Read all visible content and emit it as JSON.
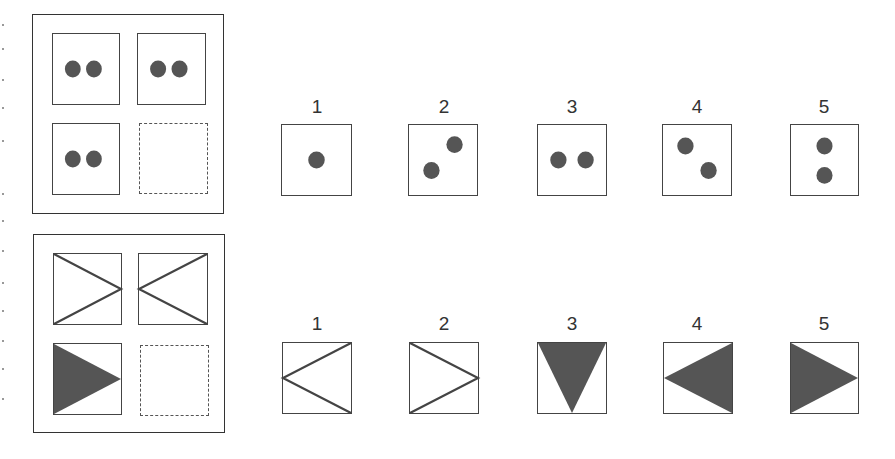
{
  "colors": {
    "fill": "#555555",
    "line": "#444444"
  },
  "puzzle1": {
    "name": "dots-matrix",
    "matrix": [
      {
        "pos": "top-left",
        "dots": [
          [
            0.3,
            0.5
          ],
          [
            0.62,
            0.5
          ]
        ]
      },
      {
        "pos": "top-right",
        "dots": [
          [
            0.3,
            0.5
          ],
          [
            0.62,
            0.5
          ]
        ]
      },
      {
        "pos": "bottom-left",
        "dots": [
          [
            0.3,
            0.5
          ],
          [
            0.62,
            0.5
          ]
        ]
      },
      {
        "pos": "bottom-right",
        "missing": true
      }
    ],
    "options": [
      {
        "label": "1",
        "dots": [
          [
            0.5,
            0.5
          ]
        ]
      },
      {
        "label": "2",
        "dots": [
          [
            0.33,
            0.65
          ],
          [
            0.67,
            0.28
          ]
        ]
      },
      {
        "label": "3",
        "dots": [
          [
            0.3,
            0.5
          ],
          [
            0.7,
            0.5
          ]
        ]
      },
      {
        "label": "4",
        "dots": [
          [
            0.33,
            0.3
          ],
          [
            0.67,
            0.65
          ]
        ]
      },
      {
        "label": "5",
        "dots": [
          [
            0.5,
            0.3
          ],
          [
            0.5,
            0.72
          ]
        ]
      }
    ]
  },
  "puzzle2": {
    "name": "triangles-matrix",
    "matrix": [
      {
        "pos": "top-left",
        "shape": "lines-point-right"
      },
      {
        "pos": "top-right",
        "shape": "lines-point-left"
      },
      {
        "pos": "bottom-left",
        "shape": "filled-point-right"
      },
      {
        "pos": "bottom-right",
        "missing": true
      }
    ],
    "options": [
      {
        "label": "1",
        "shape": "lines-point-left"
      },
      {
        "label": "2",
        "shape": "lines-point-right"
      },
      {
        "label": "3",
        "shape": "filled-point-down"
      },
      {
        "label": "4",
        "shape": "filled-point-left"
      },
      {
        "label": "5",
        "shape": "filled-point-right"
      }
    ]
  }
}
